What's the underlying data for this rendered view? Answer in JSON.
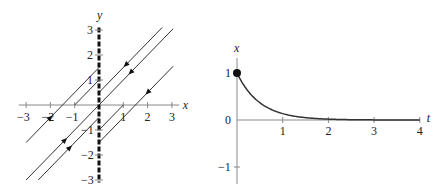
{
  "chart_data": [
    {
      "type": "line",
      "title": "Phase plane",
      "xlabel": "x",
      "ylabel": "y",
      "xlim": [
        -3,
        3
      ],
      "ylim": [
        -3,
        3
      ],
      "grid": false,
      "x_ticks": [
        "−3",
        "−2",
        "−1",
        "1",
        "2",
        "3"
      ],
      "y_ticks": [
        "3",
        "2",
        "1",
        "−1",
        "−2",
        "−3"
      ],
      "equilibrium_line": {
        "description": "x = 0 (line of equilibria, bold dashed)",
        "x": 0
      },
      "series": [
        {
          "name": "y = x + 1.5 (left)",
          "x": [
            -3,
            0
          ],
          "y": [
            -1.5,
            1.5
          ],
          "arrow": {
            "at": [
              -2,
              -0.5
            ],
            "dir": "toward x=0"
          }
        },
        {
          "name": "y = x + 1 (left)",
          "x": [
            -1,
            0
          ],
          "y": [
            0,
            1
          ]
        },
        {
          "name": "y = x (left)",
          "x": [
            -3,
            0
          ],
          "y": [
            -3,
            0
          ],
          "arrow": {
            "at": [
              -1.4,
              -1.4
            ],
            "dir": "toward x=0"
          }
        },
        {
          "name": "y = x - 0.5 (left)",
          "x": [
            -2.5,
            0
          ],
          "y": [
            -3,
            -0.5
          ],
          "arrow": {
            "at": [
              -1.2,
              -1.7
            ],
            "dir": "toward x=0"
          }
        },
        {
          "name": "y = x + 0.5 (right)",
          "x": [
            0,
            2.6
          ],
          "y": [
            0.5,
            3.1
          ],
          "arrow": {
            "at": [
              1.1,
              1.6
            ],
            "dir": "toward x=0"
          }
        },
        {
          "name": "y = x (right)",
          "x": [
            0,
            3.05
          ],
          "y": [
            0,
            3.05
          ],
          "arrow": {
            "at": [
              1.3,
              1.3
            ],
            "dir": "toward x=0"
          }
        },
        {
          "name": "y = x - 1 (right)",
          "x": [
            0,
            1
          ],
          "y": [
            -1,
            0
          ]
        },
        {
          "name": "y = x - 1.5 (right)",
          "x": [
            0,
            3.05
          ],
          "y": [
            -1.5,
            1.55
          ],
          "arrow": {
            "at": [
              2.0,
              0.5
            ],
            "dir": "toward x=0"
          }
        }
      ]
    },
    {
      "type": "line",
      "title": "Solution x(t)",
      "xlabel": "t",
      "ylabel": "x",
      "xlim": [
        0,
        4
      ],
      "ylim": [
        -1.3,
        1.3
      ],
      "grid": false,
      "x_ticks": [
        "1",
        "2",
        "3",
        "4"
      ],
      "y_ticks": [
        "1",
        "0",
        "−1"
      ],
      "initial_point": {
        "t": 0,
        "x": 1
      },
      "series": [
        {
          "name": "x(t) = e^(−2t)",
          "t": [
            0,
            0.25,
            0.5,
            0.75,
            1.0,
            1.25,
            1.5,
            1.75,
            2.0,
            2.5,
            3.0,
            3.5,
            4.0
          ],
          "x": [
            1.0,
            0.61,
            0.37,
            0.22,
            0.14,
            0.08,
            0.05,
            0.03,
            0.02,
            0.01,
            0.0,
            0.0,
            0.0
          ]
        }
      ]
    }
  ],
  "left": {
    "x_label": "x",
    "y_label": "y",
    "x_ticks": [
      {
        "v": -3,
        "label": "−3"
      },
      {
        "v": -2,
        "label": "−2"
      },
      {
        "v": -1,
        "label": "−1"
      },
      {
        "v": 1,
        "label": "1"
      },
      {
        "v": 2,
        "label": "2"
      },
      {
        "v": 3,
        "label": "3"
      }
    ],
    "y_ticks": [
      {
        "v": 3,
        "label": "3"
      },
      {
        "v": 2,
        "label": "2"
      },
      {
        "v": 1,
        "label": "1"
      },
      {
        "v": -1,
        "label": "−1"
      },
      {
        "v": -2,
        "label": "−2"
      },
      {
        "v": -3,
        "label": "−3"
      }
    ]
  },
  "right": {
    "x_label": "x",
    "t_label": "t",
    "t_ticks": [
      {
        "v": 1,
        "label": "1"
      },
      {
        "v": 2,
        "label": "2"
      },
      {
        "v": 3,
        "label": "3"
      },
      {
        "v": 4,
        "label": "4"
      }
    ],
    "x_ticks": [
      {
        "v": 1,
        "label": "1"
      },
      {
        "v": 0,
        "label": "0"
      },
      {
        "v": -1,
        "label": "−1"
      }
    ]
  },
  "colors": {
    "axis": "#888888",
    "curve": "#333333",
    "equilibrium": "#111111",
    "text": "#222222"
  }
}
